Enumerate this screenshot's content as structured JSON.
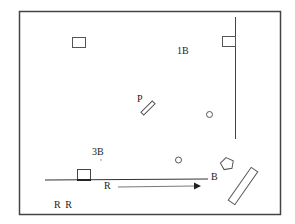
{
  "diagram": {
    "type": "floor-plan",
    "labels": {
      "first_base": "1B",
      "third_base": "3B",
      "pitcher": "P",
      "runner_label": "R",
      "base_label": "B",
      "runners_bottom": "R R"
    },
    "colors": {
      "stroke": "#333333",
      "background": "#ffffff"
    }
  }
}
